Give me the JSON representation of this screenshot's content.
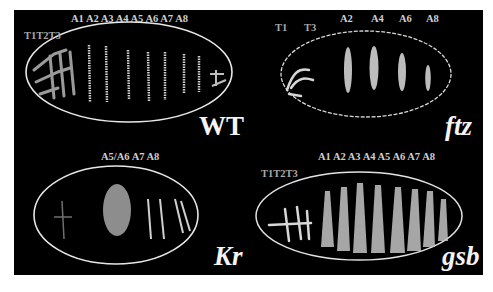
{
  "figure": {
    "background": "#000000",
    "panels": [
      {
        "id": "wt",
        "genotype": "WT",
        "italic": false,
        "thoracic_label": "T1T2T3",
        "abdominal_label": "A1 A2 A3 A4 A5 A6 A7 A8",
        "stripes": 8
      },
      {
        "id": "ftz",
        "genotype": "ftz",
        "italic": true,
        "thoracic_labels": [
          "T1",
          "T3"
        ],
        "abdominal_labels": [
          "A2",
          "A4",
          "A6",
          "A8"
        ],
        "stripes": 4
      },
      {
        "id": "kr",
        "genotype": "Kr",
        "italic": true,
        "abdominal_label": "A5/A6  A7  A8",
        "stripes": 3
      },
      {
        "id": "gsb",
        "genotype": "gsb",
        "italic": true,
        "thoracic_label": "T1T2T3",
        "abdominal_label": "A1 A2 A3 A4 A5 A6 A7 A8",
        "stripes": 8
      }
    ]
  }
}
